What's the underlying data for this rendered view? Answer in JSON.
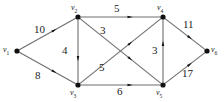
{
  "figure": {
    "kind": "directed-weighted-graph",
    "background_color": "#ffffff",
    "edge_color": "#6e6e6e",
    "node_color": "#111111",
    "text_color": "#1a1a1a"
  },
  "vertices": [
    {
      "id": "v1",
      "label": "v",
      "sub": "1",
      "x": 17,
      "y": 51,
      "label_x": 3,
      "label_y": 46
    },
    {
      "id": "v2",
      "label": "v",
      "sub": "2",
      "x": 78,
      "y": 17,
      "label_x": 71,
      "label_y": 4
    },
    {
      "id": "v3",
      "label": "v",
      "sub": "3",
      "x": 78,
      "y": 85,
      "label_x": 70,
      "label_y": 89
    },
    {
      "id": "v4",
      "label": "v",
      "sub": "4",
      "x": 163,
      "y": 17,
      "label_x": 157,
      "label_y": 4
    },
    {
      "id": "v5",
      "label": "v",
      "sub": "5",
      "x": 163,
      "y": 85,
      "label_x": 156,
      "label_y": 89
    },
    {
      "id": "v6",
      "label": "v",
      "sub": "6",
      "x": 207,
      "y": 51,
      "label_x": 211,
      "label_y": 46
    }
  ],
  "edges": [
    {
      "id": "e-v1-v2",
      "from": "v1",
      "to": "v2",
      "weight": "10",
      "label_x": 34,
      "label_y": 24
    },
    {
      "id": "e-v1-v3",
      "from": "v1",
      "to": "v3",
      "weight": "8",
      "label_x": 35,
      "label_y": 70
    },
    {
      "id": "e-v2-v4",
      "from": "v2",
      "to": "v4",
      "weight": "5",
      "label_x": 114,
      "label_y": 3
    },
    {
      "id": "e-v2-v3",
      "from": "v2",
      "to": "v3",
      "weight": "4",
      "label_x": 62,
      "label_y": 45
    },
    {
      "id": "e-v2-v5",
      "from": "v2",
      "to": "v5",
      "weight": "3",
      "label_x": 100,
      "label_y": 25
    },
    {
      "id": "e-v3-v4",
      "from": "v3",
      "to": "v4",
      "weight": "5",
      "label_x": 99,
      "label_y": 62
    },
    {
      "id": "e-v3-v5",
      "from": "v3",
      "to": "v5",
      "weight": "6",
      "label_x": 117,
      "label_y": 86
    },
    {
      "id": "e-v5-v4",
      "from": "v5",
      "to": "v4",
      "weight": "3",
      "label_x": 152,
      "label_y": 45
    },
    {
      "id": "e-v4-v6",
      "from": "v4",
      "to": "v6",
      "weight": "11",
      "label_x": 183,
      "label_y": 19
    },
    {
      "id": "e-v5-v6",
      "from": "v5",
      "to": "v6",
      "weight": "17",
      "label_x": 182,
      "label_y": 68
    }
  ]
}
